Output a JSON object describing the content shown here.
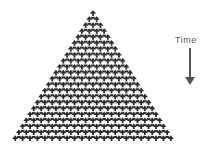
{
  "diagram": {
    "type": "cellular-automaton-evolution",
    "shape": "triangle",
    "cell_color": "#2b2b2b",
    "background": "#ffffff",
    "apex": {
      "x": 93,
      "y": 10
    },
    "base_y": 141,
    "base_left_x": 12,
    "base_right_x": 175,
    "rows": 22
  },
  "annotation": {
    "label": "Time",
    "arrow_direction": "down",
    "color": "#555555"
  }
}
